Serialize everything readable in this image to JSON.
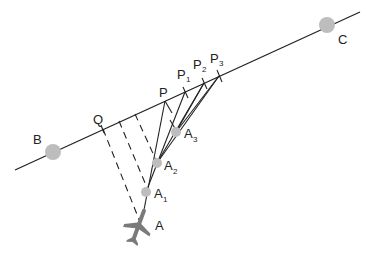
{
  "diagram": {
    "line_color": "#222222",
    "point_color": "#bdbdbd",
    "plane_color": "#7a7a7a",
    "main_line": {
      "from": [
        15,
        170
      ],
      "to": [
        360,
        12
      ]
    },
    "labels": {
      "B": "B",
      "C": "C",
      "Q": "Q",
      "P": "P",
      "P1": {
        "main": "P",
        "sub": "1"
      },
      "P2": {
        "main": "P",
        "sub": "2"
      },
      "P3": {
        "main": "P",
        "sub": "3"
      },
      "A": "A",
      "A1": {
        "main": "A",
        "sub": "1"
      },
      "A2": {
        "main": "A",
        "sub": "2"
      },
      "A3": {
        "main": "A",
        "sub": "3"
      }
    },
    "points": {
      "B": [
        53,
        152
      ],
      "C": [
        327,
        25
      ],
      "Q": [
        103,
        129
      ],
      "P": [
        165,
        101
      ],
      "P1": [
        185,
        92
      ],
      "P2": [
        204,
        83
      ],
      "P3": [
        219,
        76
      ],
      "A": [
        143,
        218
      ],
      "A1": [
        146,
        192
      ],
      "A2": [
        157,
        163
      ],
      "A3": [
        176,
        132
      ]
    }
  }
}
